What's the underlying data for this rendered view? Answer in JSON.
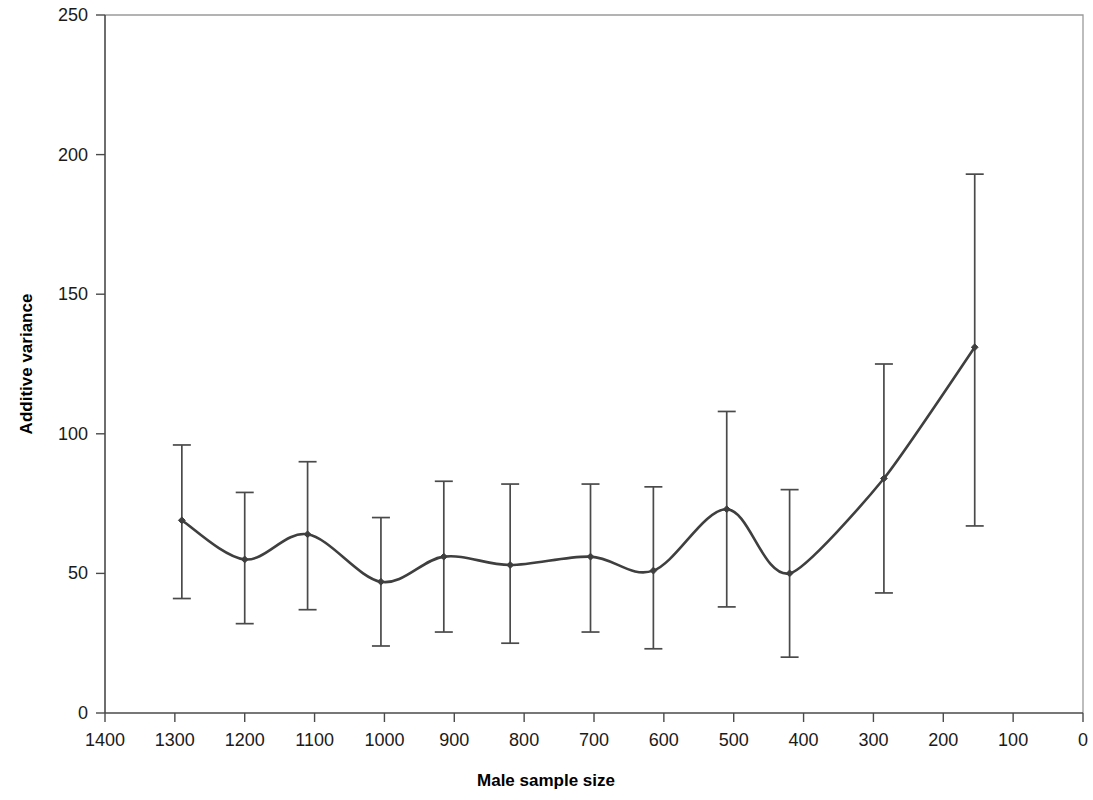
{
  "chart_data": {
    "type": "line",
    "title": "",
    "subtitle": "",
    "xlabel": "Male sample size",
    "ylabel": "Additive variance",
    "xlim": [
      1400,
      0
    ],
    "ylim": [
      0,
      250
    ],
    "x_reversed": true,
    "grid": false,
    "legend": null,
    "legend_position": "none",
    "x_ticks": [
      1400,
      1300,
      1200,
      1100,
      1000,
      900,
      800,
      700,
      600,
      500,
      400,
      300,
      200,
      100,
      0
    ],
    "x_tick_labels": [
      "1400",
      "1300",
      "1200",
      "1100",
      "1000",
      "900",
      "800",
      "700",
      "600",
      "500",
      "400",
      "300",
      "200",
      "100",
      "0"
    ],
    "y_ticks": [
      0,
      50,
      100,
      150,
      200,
      250
    ],
    "y_tick_labels": [
      "0",
      "50",
      "100",
      "150",
      "200",
      "250"
    ],
    "marker": "diamond",
    "line_color": "#3f3f3f",
    "error_bar_color": "#4a4a4a",
    "error_bars": true,
    "x": [
      1290,
      1200,
      1110,
      1005,
      915,
      820,
      705,
      615,
      510,
      420,
      285,
      155
    ],
    "values": [
      69,
      55,
      64,
      47,
      56,
      53,
      56,
      51,
      73,
      50,
      84,
      131
    ],
    "error_upper": [
      96,
      79,
      90,
      70,
      83,
      82,
      82,
      81,
      108,
      80,
      125,
      193
    ],
    "error_lower": [
      41,
      32,
      37,
      24,
      29,
      25,
      29,
      23,
      38,
      20,
      43,
      67
    ],
    "series": [
      {
        "name": "Additive variance",
        "values": [
          69,
          55,
          64,
          47,
          56,
          53,
          56,
          51,
          73,
          50,
          84,
          131
        ]
      }
    ]
  },
  "figure": {
    "background": "#ffffff",
    "axis_color": "#4a4a4a",
    "frame_color": "#9a9a9a",
    "text_color": "#1a1a1a"
  }
}
